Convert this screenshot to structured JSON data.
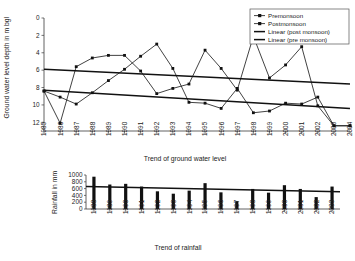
{
  "chart_data": [
    {
      "type": "line",
      "title": "",
      "xlabel": "Trend of ground water level",
      "ylabel": "Ground water level depth in m bgl",
      "x": [
        1985,
        1986,
        1987,
        1988,
        1989,
        1990,
        1991,
        1992,
        1993,
        1994,
        1995,
        1996,
        1997,
        1998,
        1999,
        2000,
        2001,
        2002,
        2003,
        2004
      ],
      "xticklabels": [
        "1985",
        "1986",
        "1987",
        "1988",
        "1989",
        "1990",
        "1991",
        "1992",
        "1993",
        "1994",
        "1995",
        "1996",
        "1997",
        "1998",
        "1999",
        "2000",
        "2001",
        "2002",
        "2003",
        "2004"
      ],
      "yticklabels": [
        "0",
        "2",
        "4",
        "6",
        "8",
        "10",
        "12"
      ],
      "ylim": [
        0,
        13
      ],
      "y_inverted": true,
      "grid": false,
      "legend_position": "top-right",
      "series": [
        {
          "name": "Premonsoon",
          "marker": "square",
          "values": [
            8.4,
            9.1,
            9.9,
            8.6,
            7.2,
            5.9,
            4.4,
            3.0,
            5.8,
            9.7,
            9.8,
            10.4,
            8.1,
            10.9,
            10.7,
            9.8,
            9.9,
            9.1,
            12.4,
            12.4
          ]
        },
        {
          "name": "Postmonsoon",
          "marker": "square",
          "values": [
            8.4,
            12.1,
            5.6,
            4.6,
            4.3,
            4.3,
            6.1,
            8.7,
            8.1,
            7.6,
            3.7,
            5.8,
            8.3,
            2.1,
            6.9,
            5.4,
            3.3,
            10.1,
            12.4,
            12.4
          ]
        }
      ],
      "trendlines": [
        {
          "name": "Linear (post monsoon)",
          "start_value": 5.9,
          "end_value": 7.6
        },
        {
          "name": "Linear (pre monsoon)",
          "start_value": 8.3,
          "end_value": 10.4
        }
      ],
      "legend": [
        "Premonsoon",
        "Postmonsoon",
        "Linear (post monsoon)",
        "Linear (pre monsoon)"
      ]
    },
    {
      "type": "bar",
      "title": "",
      "xlabel": "Trend of rainfall",
      "ylabel": "Rainfall in mm",
      "categories": [
        "1988",
        "1989",
        "1990",
        "1991",
        "1992",
        "1993",
        "1994",
        "1995",
        "1996",
        "1997",
        "1998",
        "1999",
        "2000",
        "2001",
        "2002",
        "2003"
      ],
      "values": [
        950,
        720,
        740,
        660,
        520,
        450,
        540,
        760,
        490,
        230,
        590,
        480,
        700,
        590,
        350,
        660
      ],
      "yticklabels": [
        "0",
        "200",
        "400",
        "600",
        "800",
        "1000"
      ],
      "ylim": [
        0,
        1000
      ],
      "grid": false,
      "trendline": {
        "start_value": 665,
        "end_value": 505
      }
    }
  ],
  "top_chart": {
    "ylabel": "Ground water level depth in m bgl",
    "xlabel": "Trend of ground water level",
    "legend": [
      {
        "label": "Premonsoon",
        "style": "line-marker"
      },
      {
        "label": "Postmonsoon",
        "style": "line-marker"
      },
      {
        "label": "Linear (post monsoon)",
        "style": "thick-line"
      },
      {
        "label": "Linear (pre monsoon)",
        "style": "thick-line"
      }
    ]
  },
  "bottom_chart": {
    "ylabel": "Rainfall in mm",
    "xlabel": "Trend of rainfall"
  }
}
